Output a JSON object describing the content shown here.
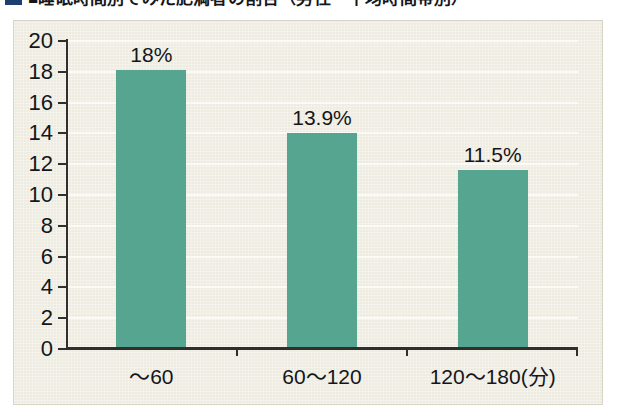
{
  "caption": {
    "bullet_color": "#1d3f70",
    "text": "■睡眠時間別でみた肥満者の割合（男性・平均時間帯別）"
  },
  "chart_data": {
    "type": "bar",
    "title": "",
    "xlabel": "",
    "ylabel": "",
    "categories": [
      "〜60",
      "60〜120",
      "120〜180(分)"
    ],
    "values": [
      18,
      13.9,
      11.5
    ],
    "value_labels": [
      "18%",
      "13.9%",
      "11.5%"
    ],
    "ylim": [
      0,
      20
    ],
    "ytick_step": 2,
    "ytick_labels": [
      "0",
      "2",
      "4",
      "6",
      "8",
      "10",
      "12",
      "14",
      "16",
      "18",
      "20"
    ],
    "grid": true,
    "legend": "none",
    "bar_color": "#56a591",
    "background_color": "#eeece0",
    "axis_color": "#2f2f2d",
    "gridline_color": "#fbfaf4",
    "text_color": "#15161a"
  }
}
